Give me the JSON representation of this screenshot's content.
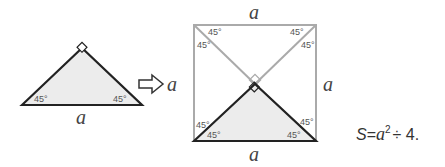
{
  "left_triangle": {
    "base_label": "a",
    "angle_left": "45°",
    "angle_right": "45°",
    "right_angle_marker": "right-angle-icon"
  },
  "arrow": {
    "icon": "right-arrow-icon",
    "label": "a"
  },
  "square": {
    "top_label": "a",
    "right_label": "a",
    "bottom_label": "a",
    "angles": {
      "top_left_a": "45°",
      "top_left_b": "45°",
      "top_right_a": "45°",
      "top_right_b": "45°",
      "bottom_left_a": "45°",
      "bottom_left_b": "45°",
      "bottom_right_a": "45°",
      "bottom_right_b": "45°"
    }
  },
  "formula": {
    "s": "S",
    "eq": "=",
    "a": "a",
    "exp": "2",
    "rest": "÷ 4."
  },
  "colors": {
    "triangle_fill": "#ececec",
    "triangle_stroke": "#222222",
    "square_stroke": "#aaaaaa"
  }
}
